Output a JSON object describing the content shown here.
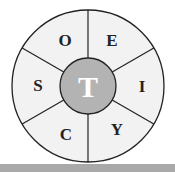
{
  "diagram": {
    "top_text": "",
    "center_letter": "T",
    "segments": [
      {
        "letter": "O",
        "position": "top-left"
      },
      {
        "letter": "E",
        "position": "top-right"
      },
      {
        "letter": "I",
        "position": "right"
      },
      {
        "letter": "Y",
        "position": "bottom-right"
      },
      {
        "letter": "C",
        "position": "bottom-left"
      },
      {
        "letter": "S",
        "position": "left"
      }
    ],
    "colors": {
      "segment_fill": "#f2f2f2",
      "center_fill": "#b3b3b3",
      "stroke": "#222222",
      "bottom_bar": "#a9a9a9"
    }
  }
}
